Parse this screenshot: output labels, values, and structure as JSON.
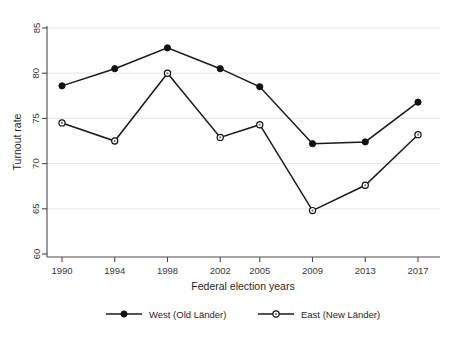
{
  "chart_data": {
    "type": "line",
    "title": "",
    "xlabel": "Federal election years",
    "ylabel": "Turnout rate",
    "x": [
      1990,
      1994,
      1998,
      2002,
      2005,
      2009,
      2013,
      2017
    ],
    "categories": [
      "1990",
      "1994",
      "1998",
      "2002",
      "2005",
      "2009",
      "2013",
      "2017"
    ],
    "xlim": [
      1990,
      2017
    ],
    "ylim": [
      60,
      85
    ],
    "yticks": [
      60,
      65,
      70,
      75,
      80,
      85
    ],
    "ytick_labels": [
      "60",
      "65",
      "70",
      "75",
      "80",
      "85"
    ],
    "grid": "horizontal",
    "legend_position": "bottom",
    "series": [
      {
        "name": "West (Old Länder)",
        "marker": "filled-circle",
        "values": [
          78.6,
          80.5,
          82.8,
          80.5,
          78.5,
          72.2,
          72.4,
          76.8
        ]
      },
      {
        "name": "East (New Länder)",
        "marker": "open-circle",
        "values": [
          74.5,
          72.5,
          80.0,
          72.9,
          74.3,
          64.8,
          67.6,
          73.2
        ]
      }
    ],
    "colors": {
      "line": "#1a1a1a",
      "grid": "#e2e2e2",
      "axis": "#4a4a4a",
      "background": "#ffffff",
      "text": "#1f1f1f"
    }
  },
  "legend": {
    "items": [
      {
        "label": "West (Old Länder)",
        "marker": "filled-circle"
      },
      {
        "label": "East (New Länder)",
        "marker": "open-circle"
      }
    ]
  },
  "axes": {
    "y_title": "Turnout rate",
    "x_title": "Federal election years",
    "y_tick_labels": [
      "85",
      "80",
      "75",
      "70",
      "65",
      "60"
    ],
    "x_tick_labels": [
      "1990",
      "1994",
      "1998",
      "2002",
      "2005",
      "2009",
      "2013",
      "2017"
    ]
  }
}
